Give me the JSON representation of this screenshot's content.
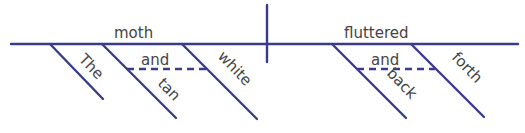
{
  "diagram": {
    "type": "sentence-diagram",
    "line_color": "#3b3b8e",
    "text_color": "#444444",
    "subject": {
      "word": "moth",
      "modifiers": [
        {
          "word": "The"
        },
        {
          "word": "tan"
        },
        {
          "word": "white"
        }
      ],
      "conjunction": "and"
    },
    "predicate": {
      "word": "fluttered",
      "modifiers": [
        {
          "word": "back"
        },
        {
          "word": "forth"
        }
      ],
      "conjunction": "and"
    }
  }
}
